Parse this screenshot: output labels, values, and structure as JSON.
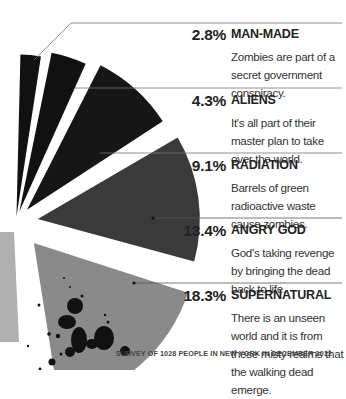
{
  "chart_data": {
    "type": "pie",
    "title": "",
    "subtitle": "",
    "categories": [
      "Man-made",
      "Aliens",
      "Radiation",
      "Angry God",
      "Supernatural"
    ],
    "values": [
      2.8,
      4.3,
      9.1,
      13.4,
      18.3
    ],
    "unit": "%",
    "partial_view": true,
    "note": "Only part of the exploded pie is visible; remaining slices cropped at left edge",
    "colors": [
      "#111111",
      "#111111",
      "#161616",
      "#3a3a3a",
      "#8a8a8a"
    ],
    "legend_position": "right",
    "grid": false
  },
  "entries": [
    {
      "pct": "2.8%",
      "label": "MAN-MADE",
      "desc": "Zombies are part of a secret government conspiracy."
    },
    {
      "pct": "4.3%",
      "label": "ALIENS",
      "desc": "It's all part of their master plan to take over the world."
    },
    {
      "pct": "9.1%",
      "label": "RADIATION",
      "desc": "Barrels of green radioactive waste cause zombies."
    },
    {
      "pct": "13.4%",
      "label": "ANGRY GOD",
      "desc": "God's taking revenge by bringing the dead back to life."
    },
    {
      "pct": "18.3%",
      "label": "SUPERNATURAL",
      "desc": "There is an unseen world and it is from these misty realms that the walking dead emerge."
    }
  ],
  "footer": "SURVEY OF 1028 PEOPLE IN NEW YORK IN DECEMBER 2012"
}
